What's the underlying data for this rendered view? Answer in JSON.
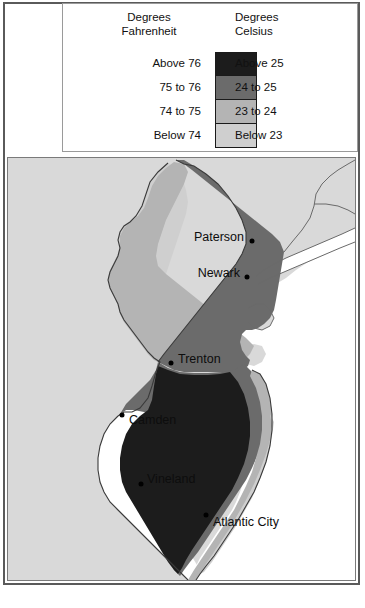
{
  "legend": {
    "heading_fahrenheit": "Degrees\nFahrenheit",
    "heading_celsius": "Degrees\nCelsius",
    "rows": [
      {
        "fahrenheit": "Above 76",
        "celsius": "Above 25",
        "color": "#1c1c1c"
      },
      {
        "fahrenheit": "75 to 76",
        "celsius": "24 to 25",
        "color": "#6b6b6b"
      },
      {
        "fahrenheit": "74 to 75",
        "celsius": "23 to 24",
        "color": "#b4b4b4"
      },
      {
        "fahrenheit": "Below 74",
        "celsius": "Below 23",
        "color": "#cfcfcf"
      }
    ]
  },
  "map": {
    "cities": [
      {
        "name": "Paterson",
        "label_x": 236,
        "label_y": 236,
        "dot_x": 244,
        "dot_y": 240,
        "align": "right"
      },
      {
        "name": "Newark",
        "label_x": 232,
        "label_y": 272,
        "dot_x": 239,
        "dot_y": 276,
        "align": "right"
      },
      {
        "name": "Trenton",
        "label_x": 170,
        "label_y": 358,
        "dot_x": 163,
        "dot_y": 362,
        "align": "left"
      },
      {
        "name": "Camden",
        "label_x": 121,
        "label_y": 419,
        "dot_x": 114,
        "dot_y": 414,
        "align": "left"
      },
      {
        "name": "Vineland",
        "label_x": 139,
        "label_y": 478,
        "dot_x": 133,
        "dot_y": 483,
        "align": "left"
      },
      {
        "name": "Atlantic City",
        "label_x": 205,
        "label_y": 521,
        "dot_x": 198,
        "dot_y": 514,
        "align": "left"
      }
    ],
    "colors": {
      "ocean": "#ffffff",
      "land_outside": "#d9d9d9",
      "band_below74": "#cfcfcf",
      "band_74_75": "#b4b4b4",
      "band_75_76": "#6b6b6b",
      "band_above76": "#1c1c1c",
      "outline": "#3a3a3a",
      "frame": "#5a5a5a"
    }
  },
  "chart_data": {
    "type": "map",
    "classes": [
      {
        "fahrenheit": "Above 76",
        "celsius": "Above 25",
        "color": "#1c1c1c"
      },
      {
        "fahrenheit": "75 to 76",
        "celsius": "24 to 25",
        "color": "#6b6b6b"
      },
      {
        "fahrenheit": "74 to 75",
        "celsius": "23 to 24",
        "color": "#b4b4b4"
      },
      {
        "fahrenheit": "Below 74",
        "celsius": "Below 23",
        "color": "#cfcfcf"
      }
    ],
    "labeled_places": [
      {
        "name": "Paterson",
        "class": "75 to 76"
      },
      {
        "name": "Newark",
        "class": "75 to 76"
      },
      {
        "name": "Trenton",
        "class": "75 to 76"
      },
      {
        "name": "Camden",
        "class": "Above 76"
      },
      {
        "name": "Vineland",
        "class": "Above 76"
      },
      {
        "name": "Atlantic City",
        "class": "74 to 75"
      }
    ],
    "legend_position": "top"
  }
}
